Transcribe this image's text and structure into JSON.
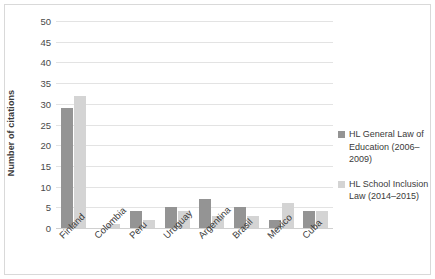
{
  "chart_data": {
    "type": "bar",
    "title": "",
    "xlabel": "",
    "ylabel": "Number of citations",
    "ylim": [
      0,
      50
    ],
    "ytick_step": 5,
    "yticks": [
      50,
      45,
      40,
      35,
      30,
      25,
      20,
      15,
      10,
      5,
      0
    ],
    "grid": true,
    "legend_position": "right",
    "categories": [
      "Finland",
      "Colombia",
      "Peru",
      "Uruguay",
      "Argentina",
      "Brasil",
      "Mexico",
      "Cuba"
    ],
    "series": [
      {
        "name": "HL General Law of Education (2006–2009)",
        "color": "#949494",
        "values": [
          29,
          0,
          4,
          5,
          7,
          5,
          2,
          4
        ]
      },
      {
        "name": "HL School Inclusion Law (2014–2015)",
        "color": "#d4d4d4",
        "values": [
          32,
          1,
          2,
          4,
          3,
          3,
          6,
          4
        ]
      }
    ]
  },
  "legend": {
    "items": [
      {
        "label": "HL General Law of Education (2006–2009)",
        "swatch": "series-0-swatch"
      },
      {
        "label": "HL School Inclusion Law (2014–2015)",
        "swatch": "series-1-swatch"
      }
    ]
  }
}
